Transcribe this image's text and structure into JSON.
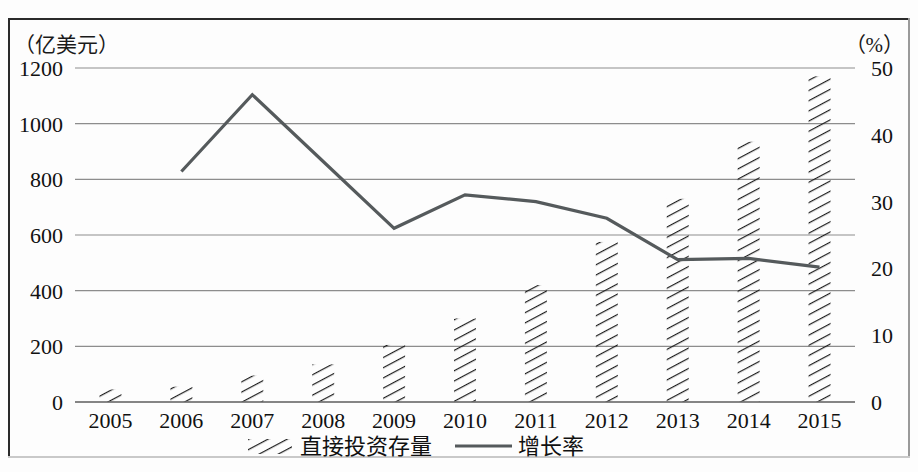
{
  "figure": {
    "left_axis_unit": "（亿美元）",
    "right_axis_unit": "（%）"
  },
  "legend": {
    "bars_label": "直接投资存量",
    "line_label": "增长率"
  },
  "chart_data": {
    "type": "bar",
    "title": "",
    "subtitle": "",
    "xlabel": "",
    "ylabel": "（亿美元）",
    "y2label": "（%）",
    "grid": true,
    "legend_position": "bottom",
    "categories": [
      "2005",
      "2006",
      "2007",
      "2008",
      "2009",
      "2010",
      "2011",
      "2012",
      "2013",
      "2014",
      "2015"
    ],
    "ylim": [
      0,
      1200
    ],
    "yticks": [
      0,
      200,
      400,
      600,
      800,
      1000,
      1200
    ],
    "y2lim": [
      0,
      50
    ],
    "y2ticks": [
      0,
      10,
      20,
      30,
      40,
      50
    ],
    "series": [
      {
        "name": "直接投资存量",
        "type": "bar",
        "axis": "left",
        "unit": "亿美元",
        "values": [
          45,
          55,
          95,
          135,
          205,
          300,
          420,
          575,
          730,
          935,
          1170
        ]
      },
      {
        "name": "增长率",
        "type": "line",
        "axis": "right",
        "unit": "%",
        "values": [
          null,
          34.5,
          46.0,
          36.0,
          26.0,
          31.0,
          30.0,
          27.5,
          21.3,
          21.5,
          20.2
        ]
      }
    ]
  }
}
